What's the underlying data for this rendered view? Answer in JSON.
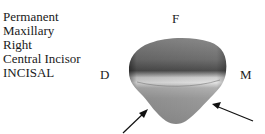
{
  "specimen": {
    "lines": [
      "Permanent",
      "Maxillary",
      "Right",
      "Central Incisor",
      "INCISAL"
    ]
  },
  "orientation": {
    "facial": "F",
    "distal": "D",
    "mesial": "M"
  },
  "figure": {
    "arrow_count": 2,
    "colors": {
      "tooth_dark": "#4a4a4a",
      "tooth_mid": "#8c8c8c",
      "tooth_light": "#d6d6d6",
      "arrow": "#111111"
    }
  }
}
